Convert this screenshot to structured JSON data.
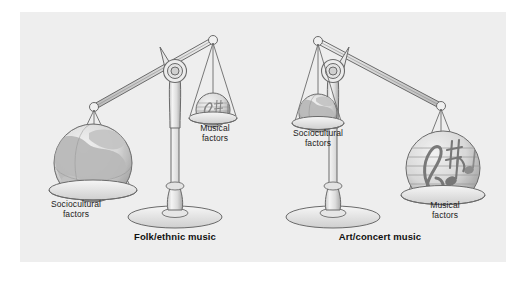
{
  "figure": {
    "background_color": "#ffffff",
    "panel_color": "#eeeeee",
    "ink_color": "#5c5c5c",
    "text_color": "#1c1c1c"
  },
  "scales": [
    {
      "id": "folk-ethnic",
      "caption": "Folk/ethnic music",
      "heavy_side": "left",
      "pans": [
        {
          "side": "left",
          "position": "down",
          "label": "Sociocultural\nfactors",
          "contents_icon": "globe-icon",
          "contents_size": "large"
        },
        {
          "side": "right",
          "position": "up",
          "label": "Musical\nfactors",
          "contents_icon": "music-notes-sphere-icon",
          "contents_size": "small"
        }
      ]
    },
    {
      "id": "art-concert",
      "caption": "Art/concert music",
      "heavy_side": "right",
      "pans": [
        {
          "side": "left",
          "position": "up",
          "label": "Sociocultural\nfactors",
          "contents_icon": "globe-icon",
          "contents_size": "small"
        },
        {
          "side": "right",
          "position": "down",
          "label": "Musical\nfactors",
          "contents_icon": "music-notes-sphere-icon",
          "contents_size": "large"
        }
      ]
    }
  ]
}
